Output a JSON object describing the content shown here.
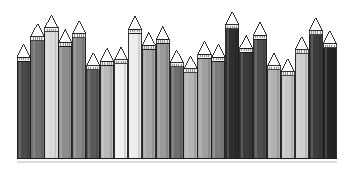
{
  "figure": {
    "title": "",
    "caption": "",
    "background_color": "#ffffff"
  },
  "chart_data": {
    "type": "bar",
    "title": "",
    "subtitle": "",
    "xlabel": "",
    "ylabel": "",
    "grid": false,
    "legend": false,
    "legend_position": "none",
    "axis_visible": false,
    "tick_labels_visible": false,
    "style": "pencil-bars",
    "categories": [
      "1",
      "2",
      "3",
      "4",
      "5",
      "6",
      "7",
      "8",
      "9",
      "10",
      "11",
      "12",
      "13",
      "14",
      "15",
      "16",
      "17",
      "18",
      "19",
      "20",
      "21",
      "22",
      "23"
    ],
    "values": [
      78,
      92,
      98,
      88,
      94,
      72,
      75,
      76,
      97,
      86,
      90,
      74,
      70,
      80,
      78,
      100,
      84,
      93,
      72,
      68,
      83,
      96,
      87
    ],
    "ylim": [
      0,
      104
    ],
    "xlim": [
      0,
      23
    ],
    "bar_colors": [
      "#4a4a4a",
      "#707070",
      "#d8d8d8",
      "#8e8e8e",
      "#888888",
      "#5a5a5a",
      "#b9b9b9",
      "#f2f2f2",
      "#ededed",
      "#a8a8a8",
      "#9a9a9a",
      "#6e6e6e",
      "#b4b4b4",
      "#a0a0a0",
      "#7c7c7c",
      "#2e2e2e",
      "#3a3a3a",
      "#4e4e4e",
      "#b0b0b0",
      "#c8c8c8",
      "#d0d0d0",
      "#3c3c3c",
      "#242424"
    ],
    "tip_color": "#ffffff",
    "outline_color": "#1a1a1a",
    "baseline_color": "#bcbcbc"
  },
  "geometry": {
    "chart_left": 17,
    "chart_right": 337,
    "baseline_y": 158,
    "bar_width": 13.2,
    "bar_gap": 0.7,
    "tip_height": 13,
    "collar_height": 4
  }
}
